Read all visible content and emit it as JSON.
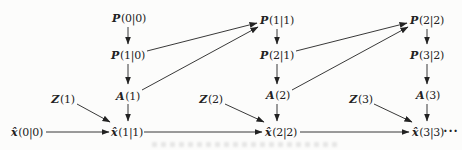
{
  "colors": {
    "paper": "#fcfcfb",
    "ink": "#222222"
  },
  "nodes": {
    "p00": {
      "symbol": "P",
      "args": "(0|0)"
    },
    "p10": {
      "symbol": "P",
      "args": "(1|0)"
    },
    "a1": {
      "symbol": "A",
      "args": "(1)"
    },
    "z1": {
      "symbol": "Z",
      "args": "(1)"
    },
    "x00": {
      "symbol": "x̂",
      "args": "(0|0)"
    },
    "x11": {
      "symbol": "x̂",
      "args": "(1|1)"
    },
    "p11": {
      "symbol": "P",
      "args": "(1|1)"
    },
    "p21": {
      "symbol": "P",
      "args": "(2|1)"
    },
    "a2": {
      "symbol": "A",
      "args": "(2)"
    },
    "z2": {
      "symbol": "Z",
      "args": "(2)"
    },
    "x22": {
      "symbol": "x̂",
      "args": "(2|2)"
    },
    "p22": {
      "symbol": "P",
      "args": "(2|2)"
    },
    "p32": {
      "symbol": "P",
      "args": "(3|2)"
    },
    "a3": {
      "symbol": "A",
      "args": "(3)"
    },
    "z3": {
      "symbol": "Z",
      "args": "(3)"
    },
    "x33": {
      "symbol": "x̂",
      "args": "(3|3)"
    },
    "ellipsis": "···"
  }
}
